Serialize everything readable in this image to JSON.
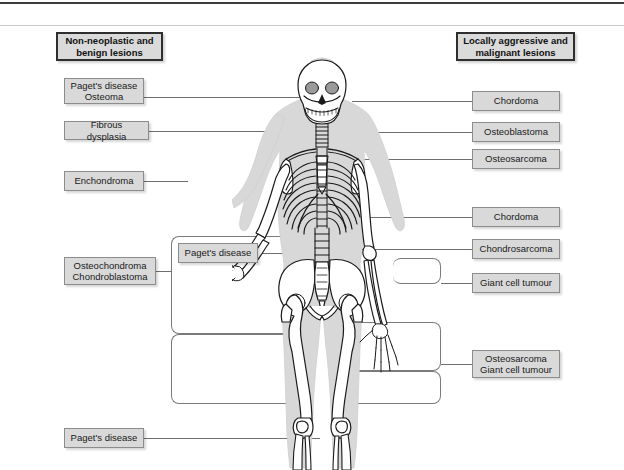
{
  "figure": {
    "title_left": "Non-neoplastic\nand benign lesions",
    "title_right": "Locally aggressive and\nmalignant lesions"
  },
  "left_labels": [
    {
      "id": "pagets-osteoma",
      "text": "Paget's disease\nOsteoma"
    },
    {
      "id": "fibrous-dysplasia",
      "text": "Fibrous dysplasia"
    },
    {
      "id": "enchondroma",
      "text": "Enchondroma"
    },
    {
      "id": "osteochondroma-chondroblastoma",
      "text": "Osteochondroma\nChondroblastoma"
    },
    {
      "id": "pagets-disease-bottom",
      "text": "Paget's disease"
    }
  ],
  "center_labels": [
    {
      "id": "pagets-disease-pelvis",
      "text": "Paget's disease"
    }
  ],
  "right_labels": [
    {
      "id": "chordoma-skull",
      "text": "Chordoma"
    },
    {
      "id": "osteoblastoma",
      "text": "Osteoblastoma"
    },
    {
      "id": "osteosarcoma-spine",
      "text": "Osteosarcoma"
    },
    {
      "id": "chordoma-sacrum",
      "text": "Chordoma"
    },
    {
      "id": "chondrosarcoma",
      "text": "Chondrosarcoma"
    },
    {
      "id": "giant-cell-tumour",
      "text": "Giant cell tumour"
    },
    {
      "id": "osteosarcoma-gct-knee",
      "text": "Osteosarcoma\nGiant cell tumour"
    }
  ],
  "colors": {
    "box_fill": "#d9d9d9",
    "box_border": "#8c8c8c",
    "title_border": "#2e2e2e",
    "leader_line": "#6f6f6f",
    "rule_dark": "#3b3b3b",
    "rule_light": "#c9c9c9",
    "bone_outline": "#1a1a1a",
    "body_silhouette": "#d5d5d5",
    "page_background": "#ffffff"
  }
}
